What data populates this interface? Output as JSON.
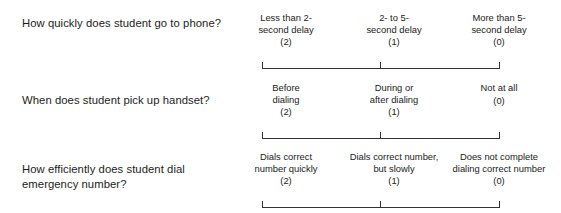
{
  "form": {
    "type": "behavioral-rating-scale",
    "scale_point_count": 3,
    "items": [
      {
        "question": "How quickly does student go to phone?",
        "anchors": [
          {
            "label": "Less than 2-\nsecond delay",
            "score": "(2)"
          },
          {
            "label": "2- to 5-\nsecond delay",
            "score": "(1)"
          },
          {
            "label": "More than 5-\nsecond delay",
            "score": "(0)"
          }
        ]
      },
      {
        "question": "When does student pick up handset?",
        "anchors": [
          {
            "label": "Before\ndialing",
            "score": "(2)"
          },
          {
            "label": "During or\nafter dialing",
            "score": "(1)"
          },
          {
            "label": "Not at all",
            "score": "(0)"
          }
        ]
      },
      {
        "question": "How efficiently does student dial emergency number?",
        "anchors": [
          {
            "label": "Dials correct\nnumber quickly",
            "score": "(2)"
          },
          {
            "label": "Dials correct number,\nbut slowly",
            "score": "(1)"
          },
          {
            "label": "Does not complete\ndialing correct number",
            "score": "(0)"
          }
        ]
      }
    ]
  },
  "colors": {
    "text": "#1c1c1c",
    "line": "#333333",
    "background": "#ffffff"
  }
}
